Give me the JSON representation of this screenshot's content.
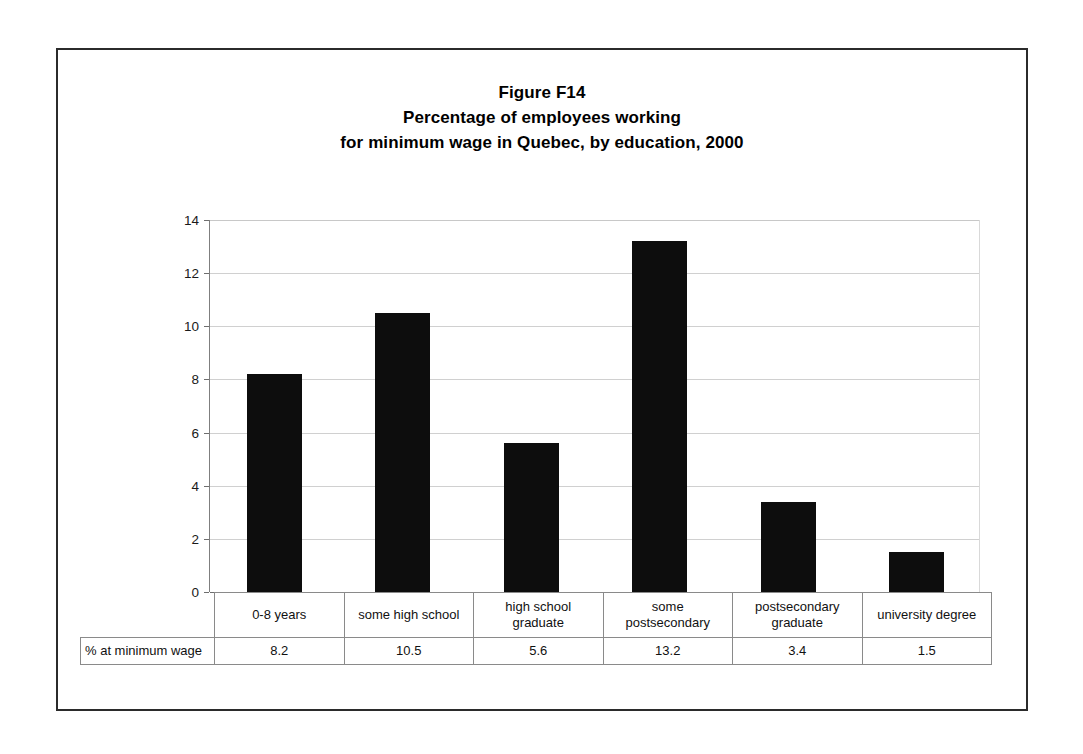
{
  "figure": {
    "title_lines": [
      "Figure F14",
      "Percentage of employees working",
      "for minimum wage in Quebec, by education, 2000"
    ],
    "row_label": "% at minimum wage"
  },
  "chart_data": {
    "type": "bar",
    "title": "Figure F14 Percentage of employees working for minimum wage in Quebec, by education, 2000",
    "categories": [
      "0-8 years",
      "some high school",
      "high school graduate",
      "some postsecondary",
      "postsecondary graduate",
      "university degree"
    ],
    "category_lines": [
      [
        "0-8 years"
      ],
      [
        "some high school"
      ],
      [
        "high school",
        "graduate"
      ],
      [
        "some",
        "postsecondary"
      ],
      [
        "postsecondary",
        "graduate"
      ],
      [
        "university degree"
      ]
    ],
    "values": [
      8.2,
      10.5,
      5.6,
      13.2,
      3.4,
      1.5
    ],
    "value_labels": [
      "8.2",
      "10.5",
      "5.6",
      "13.2",
      "3.4",
      "1.5"
    ],
    "series_name": "% at minimum wage",
    "xlabel": "",
    "ylabel": "",
    "ylim": [
      0,
      14
    ],
    "yticks": [
      0,
      2,
      4,
      6,
      8,
      10,
      12,
      14
    ],
    "ytick_labels": [
      "0",
      "2",
      "4",
      "6",
      "8",
      "10",
      "12",
      "14"
    ],
    "grid": true,
    "legend": false,
    "bar_color": "#0d0d0d",
    "gridline_color": "#d0d0d0",
    "axis_color": "#6e6e6e"
  }
}
